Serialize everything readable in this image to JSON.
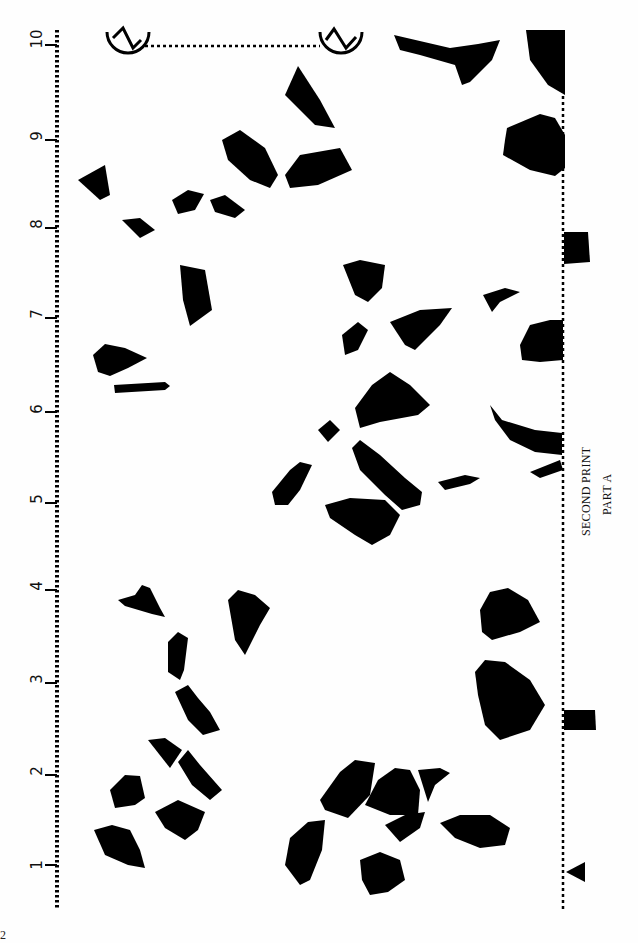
{
  "document": {
    "caption_line1": "SECOND PRINT",
    "caption_line2": "PART A",
    "page_number_fragment": "2"
  },
  "ruler": {
    "orientation": "vertical",
    "ticks": [
      {
        "label": "1",
        "y": 865
      },
      {
        "label": "2",
        "y": 775
      },
      {
        "label": "3",
        "y": 683
      },
      {
        "label": "4",
        "y": 590
      },
      {
        "label": "5",
        "y": 503
      },
      {
        "label": "6",
        "y": 412
      },
      {
        "label": "7",
        "y": 318
      },
      {
        "label": "8",
        "y": 228
      },
      {
        "label": "9",
        "y": 140
      },
      {
        "label": "10",
        "y": 45
      }
    ]
  },
  "colors": {
    "ink": "#000000",
    "paper": "#fefefe"
  }
}
